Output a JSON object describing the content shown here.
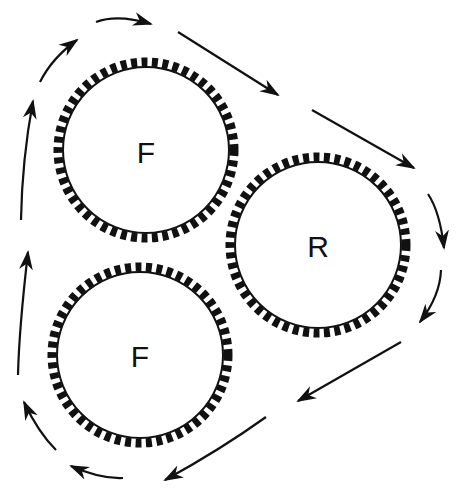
{
  "diagram": {
    "type": "gear-roll-flow",
    "colors": {
      "stroke": "#111111",
      "background": "#ffffff"
    },
    "rolls": [
      {
        "id": "top-F",
        "label": "F",
        "cx": 146,
        "cy": 150,
        "r": 86
      },
      {
        "id": "right-R",
        "label": "R",
        "cx": 318,
        "cy": 245,
        "r": 86
      },
      {
        "id": "bottom-F",
        "label": "F",
        "cx": 140,
        "cy": 355,
        "r": 86
      }
    ],
    "flow_direction": "clockwise"
  }
}
